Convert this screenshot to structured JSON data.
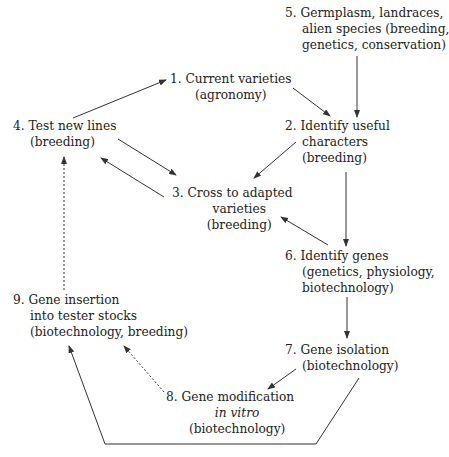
{
  "diagram": {
    "type": "flow-cycle",
    "nodes": [
      {
        "id": "n1",
        "number": "1.",
        "lines": [
          "Current varieties",
          "(agronomy)"
        ]
      },
      {
        "id": "n2",
        "number": "2.",
        "lines": [
          "Identify useful",
          "characters",
          "(breeding)"
        ]
      },
      {
        "id": "n3",
        "number": "3.",
        "lines": [
          "Cross to adapted",
          "varieties",
          "(breeding)"
        ]
      },
      {
        "id": "n4",
        "number": "4.",
        "lines": [
          "Test new lines",
          "(breeding)"
        ]
      },
      {
        "id": "n5",
        "number": "5.",
        "lines": [
          "Germplasm, landraces,",
          "alien species (breeding,",
          "genetics, conservation)"
        ]
      },
      {
        "id": "n6",
        "number": "6.",
        "lines": [
          "Identify genes",
          "(genetics, physiology,",
          "biotechnology)"
        ]
      },
      {
        "id": "n7",
        "number": "7.",
        "lines": [
          "Gene isolation",
          "(biotechnology)"
        ]
      },
      {
        "id": "n8",
        "number": "8.",
        "lines": [
          "Gene modification",
          "in vitro",
          "(biotechnology)"
        ]
      },
      {
        "id": "n9",
        "number": "9.",
        "lines": [
          "Gene insertion",
          "into tester stocks",
          "(biotechnology, breeding)"
        ]
      }
    ],
    "edges": [
      {
        "from": "n4",
        "to": "n1",
        "style": "solid"
      },
      {
        "from": "n1",
        "to": "n2",
        "style": "solid"
      },
      {
        "from": "n5",
        "to": "n2",
        "style": "solid"
      },
      {
        "from": "n4",
        "to": "n3",
        "style": "solid"
      },
      {
        "from": "n3",
        "to": "n4",
        "style": "solid"
      },
      {
        "from": "n2",
        "to": "n3",
        "style": "solid"
      },
      {
        "from": "n2",
        "to": "n6",
        "style": "solid"
      },
      {
        "from": "n6",
        "to": "n3",
        "style": "solid"
      },
      {
        "from": "n6",
        "to": "n7",
        "style": "solid"
      },
      {
        "from": "n7",
        "to": "n8",
        "style": "solid"
      },
      {
        "from": "n7",
        "to": "n9",
        "style": "solid"
      },
      {
        "from": "n8",
        "to": "n9",
        "style": "dotted"
      },
      {
        "from": "n9",
        "to": "n4",
        "style": "dotted"
      }
    ],
    "colors": {
      "line": "#333333",
      "text": "#222222",
      "background": "#ffffff"
    }
  }
}
